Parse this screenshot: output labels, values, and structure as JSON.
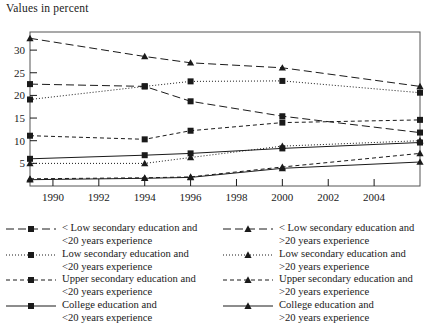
{
  "axis_title": "Values in percent",
  "chart_data": {
    "type": "line",
    "title": "",
    "xlabel": "",
    "ylabel": "Values in percent",
    "xlim": [
      1989,
      2006
    ],
    "ylim": [
      0,
      34
    ],
    "yticks": [
      5,
      10,
      15,
      20,
      25,
      30
    ],
    "xticks": [
      1990,
      1992,
      1994,
      1996,
      1998,
      2000,
      2002,
      2004
    ],
    "x": [
      1989,
      1994,
      1996,
      2000,
      2006
    ],
    "grid": false,
    "legend_position": "below",
    "series": [
      {
        "name": "< Low secondary education and <20 years experience",
        "marker": "square",
        "dash": "long-dash",
        "values": [
          22.5,
          22.0,
          18.7,
          15.4,
          11.8
        ]
      },
      {
        "name": "Low secondary education and <20 years experience",
        "marker": "square",
        "dash": "dotted",
        "values": [
          19.1,
          22.0,
          23.1,
          23.2,
          20.6
        ]
      },
      {
        "name": "Upper secondary education and <20 years experience",
        "marker": "square",
        "dash": "short-dash",
        "values": [
          11.1,
          10.3,
          12.2,
          14.0,
          14.6
        ]
      },
      {
        "name": "College education and <20 years experience",
        "marker": "square",
        "dash": "solid",
        "values": [
          6.0,
          6.8,
          7.2,
          8.3,
          9.6
        ]
      },
      {
        "name": "< Low secondary education and >20 years experience",
        "marker": "triangle",
        "dash": "long-dash",
        "values": [
          32.6,
          28.6,
          27.2,
          26.1,
          22.0
        ]
      },
      {
        "name": "Low secondary education and >20 years experience",
        "marker": "triangle",
        "dash": "dotted",
        "values": [
          5.0,
          5.0,
          6.3,
          8.8,
          10.0
        ]
      },
      {
        "name": "Upper secondary education and >20 years experience",
        "marker": "triangle",
        "dash": "short-dash",
        "values": [
          1.6,
          1.8,
          2.0,
          4.2,
          7.2
        ]
      },
      {
        "name": "College education and >20 years experience",
        "marker": "triangle",
        "dash": "solid",
        "values": [
          1.4,
          1.7,
          1.9,
          3.9,
          5.3
        ]
      }
    ]
  },
  "legend": {
    "left_column": [
      {
        "line1": "< Low secondary education and",
        "line2": "<20 years experience",
        "marker": "square",
        "dash": "long-dash"
      },
      {
        "line1": "Low secondary education and",
        "line2": "<20 years experience",
        "marker": "square",
        "dash": "dotted"
      },
      {
        "line1": "Upper secondary education and",
        "line2": "<20 years experience",
        "marker": "square",
        "dash": "short-dash"
      },
      {
        "line1": "College education and",
        "line2": "<20 years experience",
        "marker": "square",
        "dash": "solid"
      }
    ],
    "right_column": [
      {
        "line1": "< Low secondary education and",
        "line2": ">20 years experience",
        "marker": "triangle",
        "dash": "long-dash"
      },
      {
        "line1": "Low secondary education and",
        "line2": ">20 years experience",
        "marker": "triangle",
        "dash": "dotted"
      },
      {
        "line1": "Upper secondary education and",
        "line2": ">20 years experience",
        "marker": "triangle",
        "dash": "short-dash"
      },
      {
        "line1": "College education and",
        "line2": ">20 years experience",
        "marker": "triangle",
        "dash": "solid"
      }
    ]
  },
  "colors": {
    "ink": "#1a1a1a",
    "frame": "#555555",
    "background": "#ffffff"
  }
}
